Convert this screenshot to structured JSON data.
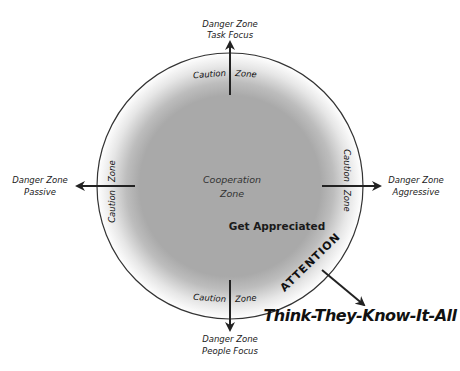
{
  "diagram": {
    "center_zone": {
      "line1": "Cooperation",
      "line2": "Zone",
      "fill": "#a9a9a9"
    },
    "ring": {
      "caution_word": "Caution",
      "zone_word": "Zone",
      "stroke": "#333333"
    },
    "directions": {
      "top": {
        "line1": "Danger Zone",
        "line2": "Task Focus"
      },
      "left": {
        "line1": "Danger Zone",
        "line2": "Passive"
      },
      "right": {
        "line1": "Danger Zone",
        "line2": "Aggressive"
      },
      "bottom": {
        "line1": "Danger Zone",
        "line2": "People Focus"
      }
    },
    "highlight": {
      "get_appreciated": "Get Appreciated",
      "attention": "ATTENTION",
      "result": "Think-They-Know-It-All"
    }
  }
}
